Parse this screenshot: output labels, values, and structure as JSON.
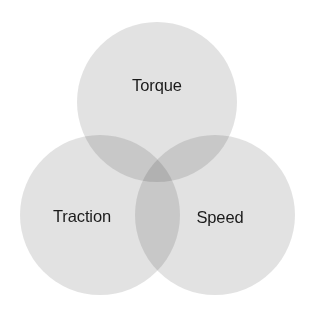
{
  "diagram": {
    "type": "venn",
    "set_count": 3,
    "background_color": "#ffffff",
    "circle_fill_color": "#e4e4e4",
    "circle_fill_opacity": 0.82,
    "pair_overlap_color": "#d2d2d2",
    "triple_overlap_color": "#c7c7c7",
    "label_color": "#1b1b1b",
    "sets": [
      {
        "id": "torque",
        "label": "Torque",
        "position": "top",
        "center_x": 157,
        "center_y": 102,
        "radius": 80,
        "label_x": 157,
        "label_y": 85
      },
      {
        "id": "traction",
        "label": "Traction",
        "position": "bottom-left",
        "center_x": 100,
        "center_y": 215,
        "radius": 80,
        "label_x": 82,
        "label_y": 216
      },
      {
        "id": "speed",
        "label": "Speed",
        "position": "bottom-right",
        "center_x": 215,
        "center_y": 215,
        "radius": 80,
        "label_x": 220,
        "label_y": 217
      }
    ]
  }
}
